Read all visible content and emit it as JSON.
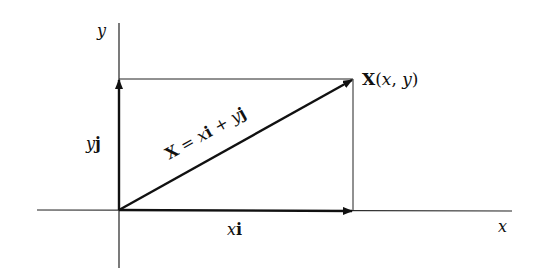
{
  "diagram": {
    "colors": {
      "ink": "#111111",
      "background": "#ffffff"
    },
    "axes": {
      "x_label": "x",
      "y_label": "y"
    },
    "vectors": {
      "horizontal": {
        "label_var": "x",
        "label_unit": "i"
      },
      "vertical": {
        "label_var": "y",
        "label_unit": "j"
      },
      "resultant": {
        "label_parts": {
          "lhs": "X",
          "eq": " = ",
          "x": "x",
          "i": "i",
          "plus": " + ",
          "y": "y",
          "j": "j"
        }
      }
    },
    "point": {
      "name": "X",
      "open": "(",
      "x": "x",
      "comma": ", ",
      "y": "y",
      "close": ")"
    }
  }
}
